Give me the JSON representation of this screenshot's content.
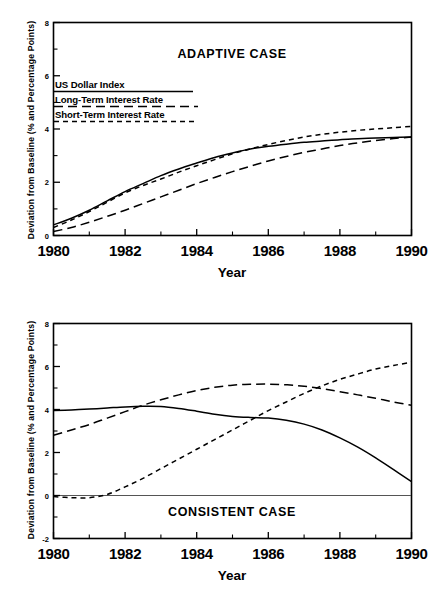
{
  "figure": {
    "xlabel": "Year",
    "ylabel": "Deviation from Baseline (% and Percentage Points)",
    "xticks": [
      "1980",
      "1982",
      "1984",
      "1986",
      "1988",
      "1990"
    ]
  },
  "panels": {
    "adaptive": {
      "title": "ADAPTIVE CASE",
      "yticks": [
        "8",
        "6",
        "4",
        "2",
        "0"
      ],
      "legend": [
        {
          "label": "US Dollar Index",
          "style": "solid"
        },
        {
          "label": "Long-Term Interest Rate",
          "style": "longdash"
        },
        {
          "label": "Short-Term Interest Rate",
          "style": "shortdash"
        }
      ]
    },
    "consistent": {
      "title": "CONSISTENT CASE",
      "yticks": [
        "8",
        "6",
        "4",
        "2",
        "0",
        "-2"
      ]
    }
  },
  "chart_data": [
    {
      "type": "line",
      "title": "ADAPTIVE CASE",
      "xlabel": "Year",
      "ylabel": "Deviation from Baseline (% and Percentage Points)",
      "xlim": [
        1980,
        1990
      ],
      "ylim": [
        0,
        8
      ],
      "xticks": [
        1980,
        1982,
        1984,
        1986,
        1988,
        1990
      ],
      "yticks": [
        0,
        2,
        4,
        6,
        8
      ],
      "grid": false,
      "legend_position": "upper-left",
      "x": [
        1980,
        1980.5,
        1981,
        1981.5,
        1982,
        1982.5,
        1983,
        1983.5,
        1984,
        1984.5,
        1985,
        1985.5,
        1986,
        1986.5,
        1987,
        1987.5,
        1988,
        1988.5,
        1989,
        1989.5,
        1990
      ],
      "series": [
        {
          "name": "US Dollar Index",
          "style": "solid",
          "values": [
            0.4,
            0.65,
            0.95,
            1.3,
            1.65,
            1.95,
            2.25,
            2.5,
            2.72,
            2.93,
            3.1,
            3.25,
            3.35,
            3.43,
            3.5,
            3.55,
            3.6,
            3.63,
            3.66,
            3.68,
            3.7
          ]
        },
        {
          "name": "Long-Term Interest Rate",
          "style": "longdash",
          "values": [
            0.15,
            0.3,
            0.5,
            0.72,
            0.95,
            1.2,
            1.45,
            1.7,
            1.95,
            2.18,
            2.4,
            2.6,
            2.8,
            2.97,
            3.12,
            3.25,
            3.38,
            3.48,
            3.57,
            3.64,
            3.7
          ]
        },
        {
          "name": "Short-Term Interest Rate",
          "style": "shortdash",
          "values": [
            0.3,
            0.58,
            0.9,
            1.25,
            1.6,
            1.88,
            2.12,
            2.38,
            2.62,
            2.85,
            3.07,
            3.25,
            3.42,
            3.57,
            3.7,
            3.8,
            3.88,
            3.95,
            4.0,
            4.05,
            4.1
          ]
        }
      ]
    },
    {
      "type": "line",
      "title": "CONSISTENT CASE",
      "xlabel": "Year",
      "ylabel": "Deviation from Baseline (% and Percentage Points)",
      "xlim": [
        1980,
        1990
      ],
      "ylim": [
        -2,
        8
      ],
      "xticks": [
        1980,
        1982,
        1984,
        1986,
        1988,
        1990
      ],
      "yticks": [
        -2,
        0,
        2,
        4,
        6,
        8
      ],
      "grid": false,
      "zero_line": true,
      "x": [
        1980,
        1980.5,
        1981,
        1981.5,
        1982,
        1982.5,
        1983,
        1983.5,
        1984,
        1984.5,
        1985,
        1985.5,
        1986,
        1986.5,
        1987,
        1987.5,
        1988,
        1988.5,
        1989,
        1989.5,
        1990
      ],
      "series": [
        {
          "name": "US Dollar Index",
          "style": "solid",
          "values": [
            3.95,
            3.98,
            4.02,
            4.07,
            4.12,
            4.15,
            4.14,
            4.05,
            3.92,
            3.78,
            3.68,
            3.63,
            3.6,
            3.5,
            3.32,
            3.05,
            2.68,
            2.25,
            1.75,
            1.2,
            0.65
          ]
        },
        {
          "name": "Long-Term Interest Rate",
          "style": "longdash",
          "values": [
            2.8,
            3.05,
            3.3,
            3.6,
            3.9,
            4.2,
            4.45,
            4.68,
            4.88,
            5.03,
            5.13,
            5.17,
            5.18,
            5.15,
            5.08,
            4.97,
            4.83,
            4.68,
            4.52,
            4.35,
            4.2
          ]
        },
        {
          "name": "Short-Term Interest Rate",
          "style": "shortdash",
          "values": [
            -0.05,
            -0.1,
            -0.1,
            0.05,
            0.4,
            0.8,
            1.25,
            1.7,
            2.15,
            2.6,
            3.05,
            3.5,
            3.95,
            4.35,
            4.75,
            5.1,
            5.4,
            5.65,
            5.88,
            6.05,
            6.2
          ]
        }
      ]
    }
  ]
}
